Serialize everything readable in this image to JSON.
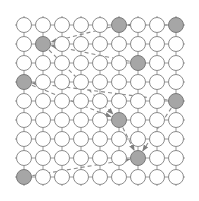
{
  "diagram": {
    "type": "grid-graph-with-tour",
    "grid": {
      "cols": 9,
      "rows": 9,
      "origin_x": 24,
      "origin_y": 25,
      "spacing": 19,
      "node_radius": 7.5,
      "stub_length": 9
    },
    "colors": {
      "background": "#ffffff",
      "edge": "#9a9a9a",
      "node_fill": "#ffffff",
      "node_stroke": "#8c8c8c",
      "active_fill": "#a6a6a6",
      "active_stroke": "#7a7a7a",
      "path": "#8a8a8a"
    },
    "active_nodes": [
      {
        "col": 5,
        "row": 0
      },
      {
        "col": 8,
        "row": 0
      },
      {
        "col": 1,
        "row": 1
      },
      {
        "col": 6,
        "row": 2
      },
      {
        "col": 0,
        "row": 3
      },
      {
        "col": 8,
        "row": 4
      },
      {
        "col": 5,
        "row": 5
      },
      {
        "col": 6,
        "row": 7
      },
      {
        "col": 0,
        "row": 8
      }
    ],
    "paths": [
      {
        "from": {
          "col": 5,
          "row": 0
        },
        "to": {
          "col": 1,
          "row": 1
        }
      },
      {
        "from": {
          "col": 6,
          "row": 2
        },
        "to": {
          "col": 1,
          "row": 1
        }
      },
      {
        "from": {
          "col": 8,
          "row": 0
        },
        "to": {
          "col": 5,
          "row": 0
        },
        "via_mid": {
          "col": 6.2,
          "row": 1.3
        }
      },
      {
        "from": {
          "col": 1,
          "row": 1
        },
        "to": {
          "col": 5,
          "row": 5
        }
      },
      {
        "from": {
          "col": 8,
          "row": 4
        },
        "to": {
          "col": 0,
          "row": 3
        }
      },
      {
        "from": {
          "col": 0,
          "row": 3
        },
        "to": {
          "col": 5,
          "row": 5
        }
      },
      {
        "from": {
          "col": 5,
          "row": 5
        },
        "to": {
          "col": 6,
          "row": 7
        }
      },
      {
        "from": {
          "col": 8,
          "row": 4
        },
        "to": {
          "col": 6,
          "row": 7
        }
      },
      {
        "from": {
          "col": 0,
          "row": 8
        },
        "to": {
          "col": 6,
          "row": 7
        }
      }
    ]
  }
}
